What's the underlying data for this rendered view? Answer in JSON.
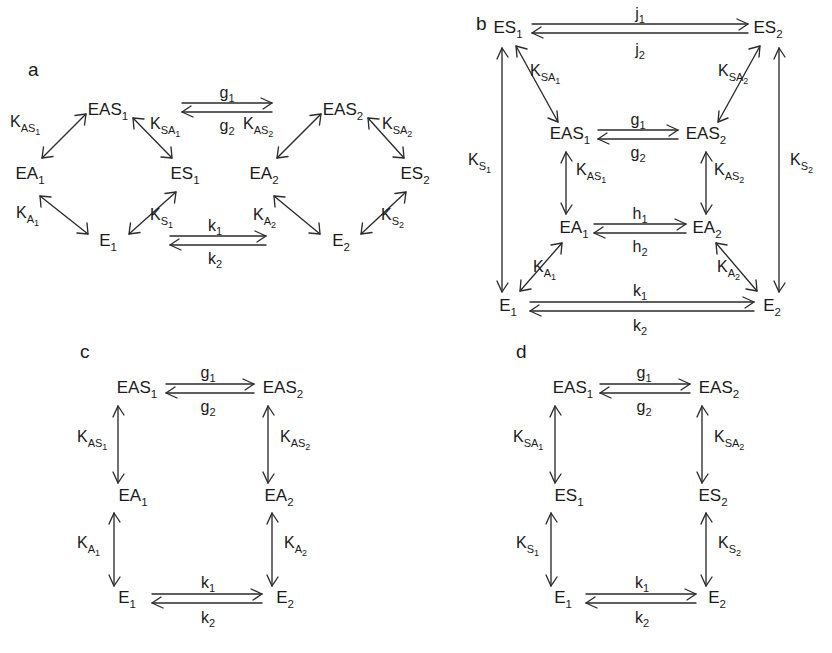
{
  "figure": {
    "background_color": "#ffffff",
    "ink_color": "#2b2b2b",
    "width": 832,
    "height": 653
  },
  "panels": [
    {
      "id": "a",
      "letter": "a",
      "description": "Two fused diamond cycles linked by g1/g2 and k1/k2 horizontal double arrows",
      "nodes": [
        {
          "id": "EAS1",
          "base": "EAS",
          "sub": "1",
          "x": 108,
          "y": 108
        },
        {
          "id": "EA1",
          "base": "EA",
          "sub": "1",
          "x": 30,
          "y": 172
        },
        {
          "id": "ES1",
          "base": "ES",
          "sub": "1",
          "x": 182,
          "y": 172
        },
        {
          "id": "E1",
          "base": "E",
          "sub": "1",
          "x": 108,
          "y": 238
        },
        {
          "id": "EAS2",
          "base": "EAS",
          "sub": "2",
          "x": 343,
          "y": 108
        },
        {
          "id": "EA2",
          "base": "EA",
          "sub": "2",
          "x": 262,
          "y": 172
        },
        {
          "id": "ES2",
          "base": "ES",
          "sub": "2",
          "x": 413,
          "y": 172
        },
        {
          "id": "E2",
          "base": "E",
          "sub": "2",
          "x": 340,
          "y": 238
        }
      ],
      "edge_labels": [
        {
          "id": "KAS1",
          "base": "K",
          "sub": "AS",
          "sub2": "1"
        },
        {
          "id": "KSA1",
          "base": "K",
          "sub": "SA",
          "sub2": "1"
        },
        {
          "id": "KA1",
          "base": "K",
          "sub": "A",
          "sub2": "1"
        },
        {
          "id": "KS1",
          "base": "K",
          "sub": "S",
          "sub2": "1"
        },
        {
          "id": "KAS2",
          "base": "K",
          "sub": "AS",
          "sub2": "2"
        },
        {
          "id": "KSA2",
          "base": "K",
          "sub": "SA",
          "sub2": "2"
        },
        {
          "id": "KA2",
          "base": "K",
          "sub": "A",
          "sub2": "2"
        },
        {
          "id": "KS2",
          "base": "K",
          "sub": "S",
          "sub2": "2"
        },
        {
          "id": "g1",
          "base": "g",
          "sub": "1",
          "sub2": ""
        },
        {
          "id": "g2",
          "base": "g",
          "sub": "2",
          "sub2": ""
        },
        {
          "id": "k1",
          "base": "k",
          "sub": "1",
          "sub2": ""
        },
        {
          "id": "k2",
          "base": "k",
          "sub": "2",
          "sub2": ""
        }
      ]
    },
    {
      "id": "b",
      "letter": "b",
      "description": "Cube-like scheme: outer ES/E square, inner EAS/EA square, connected by K diagonal arrows",
      "nodes": [
        {
          "id": "ES1",
          "base": "ES",
          "sub": "1",
          "x": 506,
          "y": 26
        },
        {
          "id": "ES2",
          "base": "ES",
          "sub": "2",
          "x": 763,
          "y": 26
        },
        {
          "id": "EAS1",
          "base": "EAS",
          "sub": "1",
          "x": 566,
          "y": 132
        },
        {
          "id": "EAS2",
          "base": "EAS",
          "sub": "2",
          "x": 700,
          "y": 132
        },
        {
          "id": "EA1",
          "base": "EA",
          "sub": "1",
          "x": 570,
          "y": 226
        },
        {
          "id": "EA2",
          "base": "EA",
          "sub": "2",
          "x": 703,
          "y": 226
        },
        {
          "id": "E1",
          "base": "E",
          "sub": "1",
          "x": 507,
          "y": 304
        },
        {
          "id": "E2",
          "base": "E",
          "sub": "2",
          "x": 768,
          "y": 304
        }
      ],
      "edge_labels": [
        {
          "id": "j1",
          "base": "j",
          "sub": "1",
          "sub2": ""
        },
        {
          "id": "j2",
          "base": "j",
          "sub": "2",
          "sub2": ""
        },
        {
          "id": "g1",
          "base": "g",
          "sub": "1",
          "sub2": ""
        },
        {
          "id": "g2",
          "base": "g",
          "sub": "2",
          "sub2": ""
        },
        {
          "id": "h1",
          "base": "h",
          "sub": "1",
          "sub2": ""
        },
        {
          "id": "h2",
          "base": "h",
          "sub": "2",
          "sub2": ""
        },
        {
          "id": "k1",
          "base": "k",
          "sub": "1",
          "sub2": ""
        },
        {
          "id": "k2",
          "base": "k",
          "sub": "2",
          "sub2": ""
        },
        {
          "id": "KSA1",
          "base": "K",
          "sub": "SA",
          "sub2": "1"
        },
        {
          "id": "KSA2",
          "base": "K",
          "sub": "SA",
          "sub2": "2"
        },
        {
          "id": "KAS1",
          "base": "K",
          "sub": "AS",
          "sub2": "1"
        },
        {
          "id": "KAS2",
          "base": "K",
          "sub": "AS",
          "sub2": "2"
        },
        {
          "id": "KA1",
          "base": "K",
          "sub": "A",
          "sub2": "1"
        },
        {
          "id": "KA2",
          "base": "K",
          "sub": "A",
          "sub2": "2"
        },
        {
          "id": "KS1",
          "base": "K",
          "sub": "S",
          "sub2": "1"
        },
        {
          "id": "KS2",
          "base": "K",
          "sub": "S",
          "sub2": "2"
        }
      ]
    },
    {
      "id": "c",
      "letter": "c",
      "description": "Square scheme with EAS1/EAS2 top, EA1/EA2 middle, E1/E2 bottom",
      "nodes": [
        {
          "id": "EAS1",
          "base": "EAS",
          "sub": "1",
          "x": 112,
          "y": 393
        },
        {
          "id": "EAS2",
          "base": "EAS",
          "sub": "2",
          "x": 258,
          "y": 393
        },
        {
          "id": "EA1",
          "base": "EA",
          "sub": "1",
          "x": 122,
          "y": 497
        },
        {
          "id": "EA2",
          "base": "EA",
          "sub": "2",
          "x": 268,
          "y": 497
        },
        {
          "id": "E1",
          "base": "E",
          "sub": "1",
          "x": 125,
          "y": 601
        },
        {
          "id": "E2",
          "base": "E",
          "sub": "2",
          "x": 277,
          "y": 601
        }
      ],
      "edge_labels": [
        {
          "id": "g1",
          "base": "g",
          "sub": "1",
          "sub2": ""
        },
        {
          "id": "g2",
          "base": "g",
          "sub": "2",
          "sub2": ""
        },
        {
          "id": "k1",
          "base": "k",
          "sub": "1",
          "sub2": ""
        },
        {
          "id": "k2",
          "base": "k",
          "sub": "2",
          "sub2": ""
        },
        {
          "id": "KAS1",
          "base": "K",
          "sub": "AS",
          "sub2": "1"
        },
        {
          "id": "KAS2",
          "base": "K",
          "sub": "AS",
          "sub2": "2"
        },
        {
          "id": "KA1",
          "base": "K",
          "sub": "A",
          "sub2": "1"
        },
        {
          "id": "KA2",
          "base": "K",
          "sub": "A",
          "sub2": "2"
        }
      ]
    },
    {
      "id": "d",
      "letter": "d",
      "description": "Square scheme with EAS1/EAS2 top, ES1/ES2 middle, E1/E2 bottom",
      "nodes": [
        {
          "id": "EAS1",
          "base": "EAS",
          "sub": "1",
          "x": 548,
          "y": 393
        },
        {
          "id": "EAS2",
          "base": "EAS",
          "sub": "2",
          "x": 694,
          "y": 393
        },
        {
          "id": "ES1",
          "base": "ES",
          "sub": "1",
          "x": 558,
          "y": 497
        },
        {
          "id": "ES2",
          "base": "ES",
          "sub": "2",
          "x": 700,
          "y": 497
        },
        {
          "id": "E1",
          "base": "E",
          "sub": "1",
          "x": 562,
          "y": 601
        },
        {
          "id": "E2",
          "base": "E",
          "sub": "2",
          "x": 710,
          "y": 601
        }
      ],
      "edge_labels": [
        {
          "id": "g1",
          "base": "g",
          "sub": "1",
          "sub2": ""
        },
        {
          "id": "g2",
          "base": "g",
          "sub": "2",
          "sub2": ""
        },
        {
          "id": "k1",
          "base": "k",
          "sub": "1",
          "sub2": ""
        },
        {
          "id": "k2",
          "base": "k",
          "sub": "2",
          "sub2": ""
        },
        {
          "id": "KSA1",
          "base": "K",
          "sub": "SA",
          "sub2": "1"
        },
        {
          "id": "KSA2",
          "base": "K",
          "sub": "SA",
          "sub2": "2"
        },
        {
          "id": "KS1",
          "base": "K",
          "sub": "S",
          "sub2": "1"
        },
        {
          "id": "KS2",
          "base": "K",
          "sub": "S",
          "sub2": "2"
        }
      ]
    }
  ],
  "labels": {
    "panel_a": "a",
    "panel_b": "b",
    "panel_c": "c",
    "panel_d": "d",
    "EAS1": "EAS",
    "EAS2": "EAS",
    "EA1": "EA",
    "EA2": "EA",
    "ES1": "ES",
    "ES2": "ES",
    "E1": "E",
    "E2": "E",
    "sub1": "1",
    "sub2": "2",
    "K": "K",
    "g": "g",
    "h": "h",
    "j": "j",
    "k": "k",
    "AS": "AS",
    "SA": "SA",
    "A": "A",
    "S": "S"
  }
}
